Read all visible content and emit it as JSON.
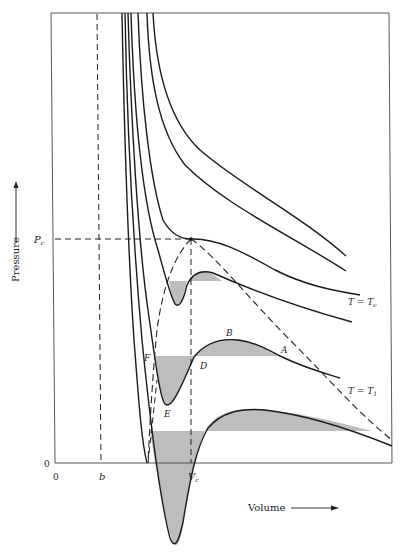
{
  "diagram": {
    "type": "pv-isotherms",
    "axes": {
      "x_label": "Volume",
      "y_label": "Pressure",
      "x_origin_label": "0",
      "y_origin_label": "0",
      "x_marks": [
        {
          "label": "b",
          "name": "excluded-volume"
        },
        {
          "label": "V",
          "subscript": "c",
          "name": "critical-volume"
        }
      ],
      "y_marks": [
        {
          "label": "P",
          "subscript": "c",
          "name": "critical-pressure"
        }
      ]
    },
    "isotherm_labels": {
      "critical": {
        "main": "T = T",
        "sub": "c"
      },
      "t1": {
        "main": "T = T",
        "sub": "1"
      }
    },
    "points": {
      "A": "A",
      "B": "B",
      "D": "D",
      "E": "E",
      "F": "F"
    },
    "colors": {
      "line": "#1a1a1a",
      "frame": "#555555",
      "shade": "#bdbdbd",
      "background": "#ffffff"
    }
  }
}
